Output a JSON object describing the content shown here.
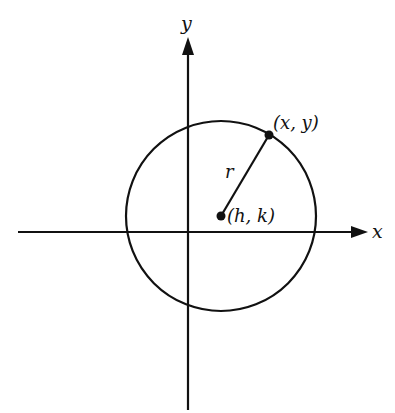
{
  "diagram": {
    "colors": {
      "stroke": "#111111",
      "background": "#ffffff"
    },
    "axes": {
      "x_label": "x",
      "y_label": "y"
    },
    "circle": {
      "center_label": "(h, k)",
      "point_label": "(x, y)",
      "radius_label": "r"
    }
  }
}
